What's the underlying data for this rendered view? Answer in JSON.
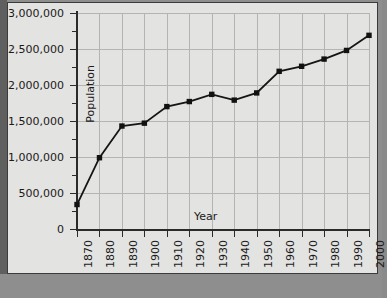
{
  "chart_data": {
    "type": "line",
    "title": "",
    "xlabel": "Year",
    "ylabel": "Population",
    "x": [
      1870,
      1880,
      1890,
      1900,
      1910,
      1920,
      1930,
      1940,
      1950,
      1960,
      1970,
      1980,
      1990,
      2000
    ],
    "values": [
      340000,
      990000,
      1430000,
      1470000,
      1700000,
      1770000,
      1870000,
      1790000,
      1890000,
      2190000,
      2260000,
      2360000,
      2480000,
      2690000
    ],
    "series": [
      {
        "name": "Population",
        "values": [
          340000,
          990000,
          1430000,
          1470000,
          1700000,
          1770000,
          1870000,
          1790000,
          1890000,
          2190000,
          2260000,
          2360000,
          2480000,
          2690000
        ]
      }
    ],
    "xlim": [
      1870,
      2000
    ],
    "ylim": [
      0,
      3000000
    ],
    "xtick_labels": [
      "1870",
      "1880",
      "1890",
      "1900",
      "1910",
      "1920",
      "1930",
      "1940",
      "1950",
      "1960",
      "1970",
      "1980",
      "1990",
      "2000"
    ],
    "ytick_labels": [
      "0",
      "500,000",
      "1,000,000",
      "1,500,000",
      "2,000,000",
      "2,500,000",
      "3,000,000"
    ],
    "ytick_values": [
      0,
      500000,
      1000000,
      1500000,
      2000000,
      2500000,
      3000000
    ],
    "yminor_step": 250000,
    "grid": true,
    "legend": "none",
    "marker": "square",
    "line_color": "#151515",
    "marker_color": "#111111",
    "grid_color": "#b4b4b2",
    "plot_background": "#e3e3e1",
    "page_background": "#8e8e8e"
  },
  "axis_titles": {
    "x": "Year",
    "y": "Population"
  }
}
